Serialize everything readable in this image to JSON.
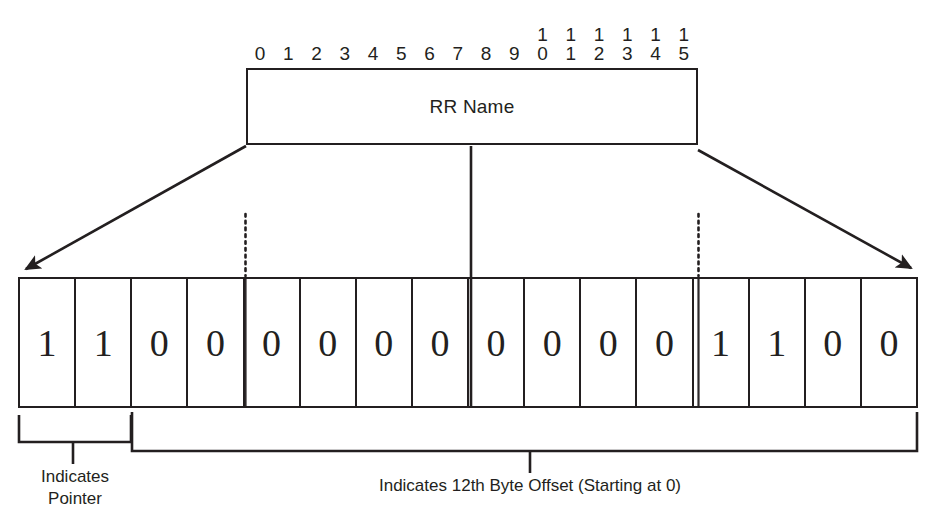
{
  "diagram": {
    "ruler": {
      "label": "bit-index-ruler",
      "ticks": [
        {
          "hi": "",
          "lo": "0"
        },
        {
          "hi": "",
          "lo": "1"
        },
        {
          "hi": "",
          "lo": "2"
        },
        {
          "hi": "",
          "lo": "3"
        },
        {
          "hi": "",
          "lo": "4"
        },
        {
          "hi": "",
          "lo": "5"
        },
        {
          "hi": "",
          "lo": "6"
        },
        {
          "hi": "",
          "lo": "7"
        },
        {
          "hi": "",
          "lo": "8"
        },
        {
          "hi": "",
          "lo": "9"
        },
        {
          "hi": "1",
          "lo": "0"
        },
        {
          "hi": "1",
          "lo": "1"
        },
        {
          "hi": "1",
          "lo": "2"
        },
        {
          "hi": "1",
          "lo": "3"
        },
        {
          "hi": "1",
          "lo": "4"
        },
        {
          "hi": "1",
          "lo": "5"
        }
      ]
    },
    "field_box": {
      "label": "RR Name"
    },
    "bits": [
      "1",
      "1",
      "0",
      "0",
      "0",
      "0",
      "0",
      "0",
      "0",
      "0",
      "0",
      "0",
      "1",
      "1",
      "0",
      "0"
    ],
    "annotations": {
      "pointer": "Indicates\nPointer",
      "pointer_line1": "Indicates",
      "pointer_line2": "Pointer",
      "offset": "Indicates 12th Byte Offset (Starting at 0)"
    },
    "colors": {
      "ink": "#231f20",
      "background": "#ffffff"
    }
  }
}
